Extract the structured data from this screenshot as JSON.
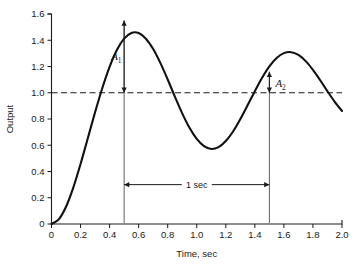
{
  "chart_data": {
    "type": "line",
    "title": "",
    "xlabel": "Time, sec",
    "ylabel": "Output",
    "xlim": [
      0,
      2.0
    ],
    "ylim": [
      0,
      1.6
    ],
    "grid": false,
    "legend": "none",
    "xticks": [
      "0",
      "0.2",
      "0.4",
      "0.6",
      "0.8",
      "1.0",
      "1.2",
      "1.4",
      "1.6",
      "1.8",
      "2.0"
    ],
    "yticks": [
      "0",
      "0.2",
      "0.4",
      "0.6",
      "0.8",
      "1.0",
      "1.2",
      "1.4",
      "1.6"
    ],
    "series": [
      {
        "name": "step response",
        "x": [
          0.0,
          0.05,
          0.1,
          0.15,
          0.2,
          0.25,
          0.3,
          0.35,
          0.4,
          0.45,
          0.5,
          0.55,
          0.6,
          0.65,
          0.7,
          0.75,
          0.8,
          0.85,
          0.9,
          0.95,
          1.0,
          1.05,
          1.1,
          1.15,
          1.2,
          1.25,
          1.3,
          1.35,
          1.4,
          1.45,
          1.5,
          1.55,
          1.6,
          1.65,
          1.7,
          1.75,
          1.8,
          1.85,
          1.9,
          1.95,
          2.0
        ],
        "y": [
          0.0,
          0.035,
          0.131,
          0.277,
          0.457,
          0.654,
          0.851,
          1.036,
          1.197,
          1.325,
          1.412,
          1.456,
          1.455,
          1.412,
          1.333,
          1.226,
          1.101,
          0.969,
          0.843,
          0.733,
          0.648,
          0.593,
          0.572,
          0.586,
          0.632,
          0.705,
          0.799,
          0.904,
          1.012,
          1.114,
          1.201,
          1.265,
          1.302,
          1.309,
          1.288,
          1.241,
          1.174,
          1.095,
          1.011,
          0.931,
          0.861
        ]
      }
    ],
    "reference_line": {
      "value": 1.0,
      "style": "dashed",
      "label": ""
    },
    "annotations": [
      {
        "name": "A1",
        "label": "A",
        "subscript": "1",
        "from_y": 1.55,
        "to_y": 1.0,
        "at_x": 0.5,
        "kind": "double-arrow-vertical"
      },
      {
        "name": "A2",
        "label": "A",
        "subscript": "2",
        "from_y": 1.16,
        "to_y": 1.0,
        "at_x": 1.5,
        "kind": "double-arrow-vertical"
      },
      {
        "name": "period",
        "label": "1 sec",
        "from_x": 0.5,
        "to_x": 1.5,
        "at_y": 0.3,
        "kind": "double-arrow-horizontal"
      }
    ],
    "peaks": [
      {
        "time": 0.5,
        "output": 1.55
      },
      {
        "time": 1.5,
        "output": 1.16
      }
    ],
    "troughs": [
      {
        "time": 1.0,
        "output": 0.69
      }
    ]
  }
}
